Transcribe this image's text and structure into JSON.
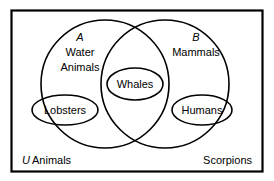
{
  "figure": {
    "type": "venn-diagram",
    "universe": {
      "letter": "U",
      "label": "Animals"
    },
    "outside_label": "Scorpions",
    "sets": [
      {
        "id": "A",
        "letter": "A",
        "name_line1": "Water",
        "name_line2": "Animals",
        "members": [
          "Lobsters"
        ]
      },
      {
        "id": "B",
        "letter": "B",
        "name_line1": "Mammals",
        "name_line2": "",
        "members": [
          "Humans"
        ]
      }
    ],
    "intersection": {
      "label": "Whales"
    },
    "items": {
      "lobsters": "Lobsters",
      "whales": "Whales",
      "humans": "Humans"
    },
    "colors": {
      "stroke": "#000000",
      "background": "#ffffff",
      "text": "#000000"
    }
  }
}
